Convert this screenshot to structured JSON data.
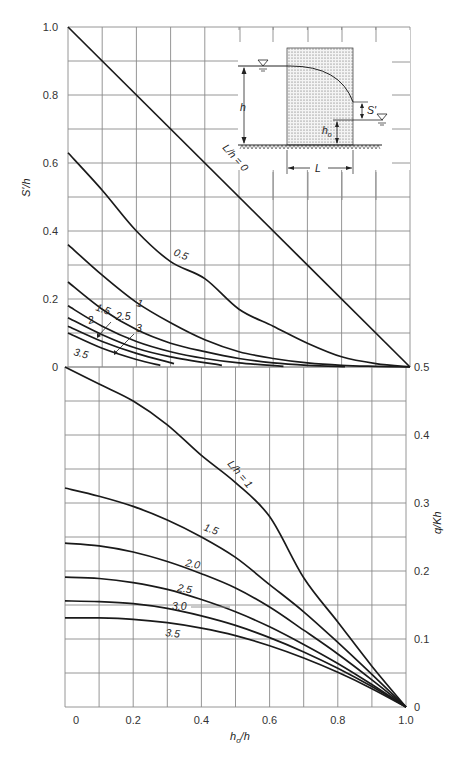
{
  "chart_data": [
    {
      "type": "line",
      "title": "",
      "xlabel": "h_o/h",
      "ylabel": "S'/h",
      "xlim": [
        0,
        1.0
      ],
      "ylim": [
        0,
        1.0
      ],
      "grid": true,
      "x_ticks": [
        "0",
        "0.2",
        "0.4",
        "0.6",
        "0.8",
        "1.0"
      ],
      "y_ticks": [
        "0",
        "0.2",
        "0.4",
        "0.6",
        "0.8",
        "1.0"
      ],
      "series": [
        {
          "name": "L/h = 0",
          "label": "L/h = 0",
          "x": [
            0,
            1.0
          ],
          "y": [
            1.0,
            0
          ]
        },
        {
          "name": "0.5",
          "label": "0.5",
          "x": [
            0,
            0.1,
            0.2,
            0.3,
            0.4,
            0.5,
            0.6,
            0.7,
            0.8,
            0.9,
            1.0
          ],
          "y": [
            0.63,
            0.52,
            0.4,
            0.31,
            0.26,
            0.17,
            0.12,
            0.07,
            0.03,
            0.01,
            0
          ]
        },
        {
          "name": "1",
          "label": "1",
          "x": [
            0,
            0.1,
            0.2,
            0.3,
            0.4,
            0.5,
            0.6,
            0.7,
            0.8,
            0.9,
            1.0
          ],
          "y": [
            0.36,
            0.27,
            0.19,
            0.13,
            0.08,
            0.045,
            0.025,
            0.012,
            0.005,
            0.002,
            0
          ]
        },
        {
          "name": "1.5",
          "label": "1.5",
          "x": [
            0,
            0.1,
            0.2,
            0.3,
            0.4,
            0.5,
            0.6,
            0.7,
            0.81
          ],
          "y": [
            0.25,
            0.17,
            0.11,
            0.07,
            0.045,
            0.025,
            0.012,
            0.005,
            0.001
          ]
        },
        {
          "name": "2",
          "label": "2",
          "x": [
            0,
            0.1,
            0.2,
            0.3,
            0.4,
            0.5,
            0.63
          ],
          "y": [
            0.18,
            0.12,
            0.075,
            0.045,
            0.025,
            0.012,
            0.002
          ]
        },
        {
          "name": "2.5",
          "label": "2.5",
          "x": [
            0,
            0.1,
            0.2,
            0.3,
            0.45
          ],
          "y": [
            0.145,
            0.095,
            0.055,
            0.03,
            0.005
          ]
        },
        {
          "name": "3",
          "label": "3",
          "x": [
            0,
            0.1,
            0.2,
            0.31
          ],
          "y": [
            0.12,
            0.075,
            0.04,
            0.01
          ]
        },
        {
          "name": "3.5",
          "label": "3.5",
          "x": [
            0,
            0.1,
            0.2,
            0.27
          ],
          "y": [
            0.1,
            0.055,
            0.022,
            0.005
          ]
        }
      ]
    },
    {
      "type": "line",
      "title": "",
      "xlabel": "h_o/h",
      "ylabel": "q/Kh",
      "xlim": [
        0,
        1.0
      ],
      "ylim": [
        0,
        0.5
      ],
      "grid": true,
      "x_ticks": [
        "0",
        "0.2",
        "0.4",
        "0.6",
        "0.8",
        "1.0"
      ],
      "y_ticks": [
        "0",
        "0.1",
        "0.2",
        "0.3",
        "0.4",
        "0.5"
      ],
      "series": [
        {
          "name": "L/h = 1",
          "label": "L/h = 1",
          "x": [
            0,
            0.1,
            0.2,
            0.3,
            0.4,
            0.5,
            0.6,
            0.7,
            0.8,
            0.9,
            1.0
          ],
          "y": [
            0.5,
            0.475,
            0.45,
            0.415,
            0.37,
            0.33,
            0.28,
            0.19,
            0.125,
            0.06,
            0
          ]
        },
        {
          "name": "1.5",
          "label": "1.5",
          "x": [
            0,
            0.1,
            0.2,
            0.3,
            0.4,
            0.5,
            0.6,
            0.7,
            0.8,
            0.9,
            1.0
          ],
          "y": [
            0.322,
            0.31,
            0.295,
            0.275,
            0.25,
            0.22,
            0.18,
            0.14,
            0.095,
            0.048,
            0
          ]
        },
        {
          "name": "2.0",
          "label": "2.0",
          "x": [
            0,
            0.1,
            0.2,
            0.3,
            0.4,
            0.5,
            0.6,
            0.7,
            0.8,
            0.9,
            1.0
          ],
          "y": [
            0.241,
            0.237,
            0.228,
            0.214,
            0.196,
            0.175,
            0.147,
            0.113,
            0.078,
            0.04,
            0
          ]
        },
        {
          "name": "2.5",
          "label": "2.5",
          "x": [
            0,
            0.1,
            0.2,
            0.3,
            0.4,
            0.5,
            0.6,
            0.7,
            0.8,
            0.9,
            1.0
          ],
          "y": [
            0.191,
            0.189,
            0.183,
            0.173,
            0.158,
            0.14,
            0.118,
            0.092,
            0.064,
            0.033,
            0
          ]
        },
        {
          "name": "3.0",
          "label": "3.0",
          "x": [
            0,
            0.1,
            0.2,
            0.3,
            0.4,
            0.5,
            0.6,
            0.7,
            0.8,
            0.9,
            1.0
          ],
          "y": [
            0.156,
            0.155,
            0.152,
            0.145,
            0.134,
            0.12,
            0.102,
            0.081,
            0.057,
            0.03,
            0
          ]
        },
        {
          "name": "3.5",
          "label": "3.5",
          "x": [
            0,
            0.1,
            0.2,
            0.3,
            0.4,
            0.5,
            0.6,
            0.7,
            0.8,
            0.9,
            1.0
          ],
          "y": [
            0.131,
            0.131,
            0.129,
            0.124,
            0.116,
            0.105,
            0.09,
            0.072,
            0.051,
            0.027,
            0
          ]
        }
      ]
    }
  ],
  "labels": {
    "top_ylabel": "S'/h",
    "bottom_ylabel": "q/Kh",
    "xlabel_main": "h",
    "xlabel_sub": "o",
    "xlabel_tail": "/h",
    "top_curve_labels": [
      "L/h = 0",
      "0.5",
      "1",
      "1.5",
      "2",
      "2.5",
      "3",
      "3.5"
    ],
    "bottom_curve_labels": [
      "L/h = 1",
      "1.5",
      "2.0",
      "2.5",
      "3.0",
      "3.5"
    ]
  },
  "inset": {
    "h_label": "h",
    "ho_main": "h",
    "ho_sub": "o",
    "s_label": "S'",
    "l_label": "L"
  }
}
